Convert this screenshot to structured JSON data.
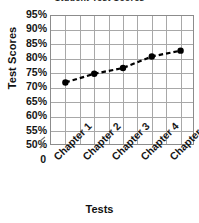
{
  "chart_data": {
    "type": "line",
    "title": "Student Test Scores",
    "xlabel": "Tests",
    "ylabel": "Test Scores",
    "categories": [
      "Chapter 1",
      "Chapter 2",
      "Chapter 3",
      "Chapter 4",
      "Chapter 5"
    ],
    "values": [
      72,
      75,
      77,
      81,
      83
    ],
    "series": [
      {
        "name": "Test Scores",
        "values": [
          72,
          75,
          77,
          81,
          83
        ]
      }
    ],
    "ylim": [
      50,
      95
    ],
    "ytick_step": 5,
    "ytick_labels": [
      "95%",
      "90%",
      "85%",
      "80%",
      "75%",
      "70%",
      "65%",
      "60%",
      "55%",
      "50%"
    ],
    "ytick_values": [
      95,
      90,
      85,
      80,
      75,
      70,
      65,
      60,
      55,
      50
    ],
    "value_suffix": "%",
    "origin_label": "0",
    "axis_break": true,
    "grid": true,
    "grid_horizontal": true,
    "grid_vertical": true,
    "legend": false,
    "line_style": "dashed",
    "marker": "circle",
    "series_color": "#000000",
    "grid_color": "#a8a8a8",
    "axis_color": "#8c8c8c",
    "text_color": "#161616",
    "background_color": "#ffffff",
    "xlabel_rotation": -45
  }
}
